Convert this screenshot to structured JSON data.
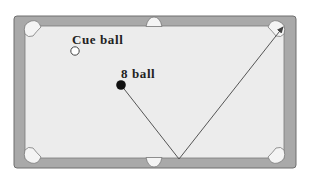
{
  "diagram": {
    "type": "pool-table-bank-shot",
    "labels": {
      "cue_ball": "Cue ball",
      "eight_ball": "8 ball"
    },
    "colors": {
      "rail": "#a9a9a9",
      "rail_border": "#6f6f6f",
      "felt": "#ececec",
      "pocket": "#f4f4f4",
      "path": "#555555",
      "eight_ball": "#111111",
      "cue_ball_fill": "#ffffff",
      "cue_ball_stroke": "#444444",
      "label": "#222222"
    },
    "balls": [
      {
        "name": "cue-ball",
        "x": 75,
        "y": 51
      },
      {
        "name": "eight-ball",
        "x": 121,
        "y": 85
      }
    ],
    "path_points": [
      [
        121,
        85
      ],
      [
        179,
        159
      ],
      [
        285,
        25
      ]
    ],
    "bank_point": [
      179,
      159
    ],
    "target_pocket": "top-right"
  }
}
